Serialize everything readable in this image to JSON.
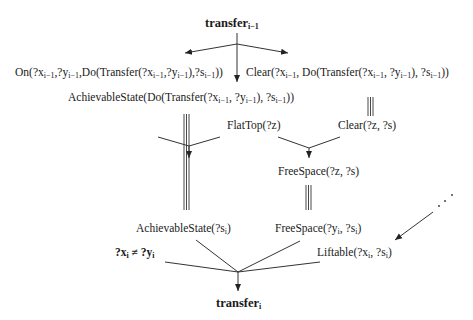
{
  "diagram": {
    "type": "derivation-graph",
    "nodes": {
      "top": {
        "pre": "transfer",
        "sub": "i−1"
      },
      "on": {
        "text": "On(?x",
        "s1": "i−1",
        "t2": ",?y",
        "s2": "i−1",
        "t3": ",Do(Transfer(?x",
        "s3": "i−1",
        "t4": ",?y",
        "s4": "i−1",
        "t5": "),?s",
        "s5": "i−1",
        "t6": "))"
      },
      "clear_prev": {
        "text": "Clear(?x",
        "s1": "i−1",
        "t2": ", Do(Transfer(?x",
        "s2": "i−1",
        "t3": ", ?y",
        "s3": "i−1",
        "t4": "), ?s",
        "s4": "i−1",
        "t5": "))"
      },
      "achievable_prev": {
        "text": "AchievableState(Do(Transfer(?x",
        "s1": "i−1",
        "t2": ", ?y",
        "s2": "i−1",
        "t3": "), ?s",
        "s3": "i−1",
        "t4": "))"
      },
      "flattop": {
        "text": "FlatTop(?z)"
      },
      "clear_z": {
        "text": "Clear(?z, ?s)"
      },
      "freespace_z": {
        "text": "FreeSpace(?z, ?s)"
      },
      "achievable_i": {
        "text": "AchievableState(?s",
        "s1": "i",
        "t2": ")"
      },
      "freespace_i": {
        "text": "FreeSpace(?y",
        "s1": "i",
        "t2": ", ?s",
        "s2": "i",
        "t3": ")"
      },
      "neq": {
        "t1": "?x",
        "s1": "i",
        "t2": " ≠ ?y",
        "s2": "i"
      },
      "liftable": {
        "text": "Liftable(?x",
        "s1": "i",
        "t2": ", ?s",
        "s2": "i",
        "t3": ")"
      },
      "bottom": {
        "pre": "transfer",
        "sub": "i"
      }
    },
    "edges": [
      {
        "from": "top",
        "to": "on",
        "type": "arrow"
      },
      {
        "from": "top",
        "to": "achievable_prev",
        "type": "arrow"
      },
      {
        "from": "top",
        "to": "clear_prev",
        "type": "arrow"
      },
      {
        "from": "clear_prev",
        "to": "clear_z",
        "type": "equivalence"
      },
      {
        "from": "flattop",
        "to": "freespace_z",
        "type": "arrow"
      },
      {
        "from": "clear_z",
        "to": "freespace_z",
        "type": "arrow"
      },
      {
        "from": "achievable_prev",
        "to": "achievable_i",
        "type": "equivalence"
      },
      {
        "from": "freespace_z",
        "to": "freespace_i",
        "type": "equivalence"
      },
      {
        "from": "ellipsis",
        "to": "liftable",
        "type": "arrow"
      },
      {
        "from": "achievable_i",
        "to": "bottom",
        "type": "arrow"
      },
      {
        "from": "freespace_i",
        "to": "bottom",
        "type": "arrow"
      },
      {
        "from": "neq",
        "to": "bottom",
        "type": "arrow"
      },
      {
        "from": "liftable",
        "to": "bottom",
        "type": "arrow"
      }
    ],
    "ellipsis": "⋰"
  }
}
